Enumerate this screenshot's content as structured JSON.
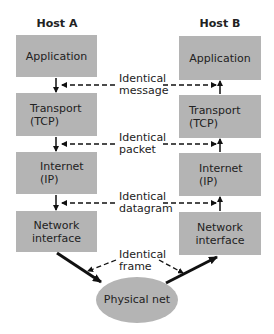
{
  "hosts": {
    "a": {
      "title": "Host A",
      "layers": [
        {
          "label": "Application"
        },
        {
          "label": "Transport\n(TCP)"
        },
        {
          "label": "Internet\n(IP)"
        },
        {
          "label": "Network\ninterface"
        }
      ]
    },
    "b": {
      "title": "Host B",
      "layers": [
        {
          "label": "Application"
        },
        {
          "label": "Transport\n(TCP)"
        },
        {
          "label": "Internet\n(IP)"
        },
        {
          "label": "Network\ninterface"
        }
      ]
    }
  },
  "peer_labels": [
    "Identical\nmessage",
    "Identical\npacket",
    "Identical\ndatagram",
    "Identical\nframe"
  ],
  "physical": {
    "label": "Physical net"
  },
  "colors": {
    "box_fill": "#b4b4b4",
    "ellipse_fill": "#b4b4b4",
    "arrow": "#111111",
    "text": "#222222"
  }
}
